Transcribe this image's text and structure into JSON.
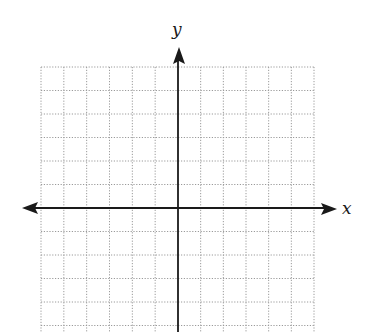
{
  "diagram": {
    "type": "coordinate-plane",
    "axes": {
      "x_label": "x",
      "y_label": "y",
      "color": "#1a1a1a",
      "origin_px": [
        178,
        208
      ]
    },
    "grid": {
      "style": "dotted",
      "color": "#9a9a9a",
      "columns_left_of_y_axis": 6,
      "columns_right_of_y_axis": 6,
      "rows_above_x_axis": 6,
      "rows_below_x_axis": 5,
      "left_px": 41,
      "right_px": 314,
      "top_px": 67,
      "bottom_px": 332
    }
  }
}
